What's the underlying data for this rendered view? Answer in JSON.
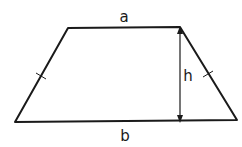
{
  "diagram": {
    "shape": "isosceles-trapezoid",
    "vertices": {
      "top_left": [
        68,
        28
      ],
      "top_right": [
        180,
        27
      ],
      "bottom_right": [
        237,
        120
      ],
      "bottom_left": [
        15,
        122
      ]
    },
    "labels": {
      "top_base": "a",
      "bottom_base": "b",
      "height": "h"
    },
    "height_line": {
      "x": 180,
      "y_top": 28,
      "y_bottom": 120
    },
    "equal_side_ticks": [
      {
        "side": "left",
        "at": [
          41,
          76
        ]
      },
      {
        "side": "right",
        "at": [
          208,
          74
        ]
      }
    ],
    "colors": {
      "stroke": "#1a1a1a",
      "background": "#ffffff"
    }
  }
}
